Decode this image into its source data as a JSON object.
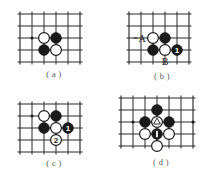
{
  "figure": {
    "panel_count": 4
  },
  "panels": {
    "a": {
      "caption": "( a )",
      "grid": {
        "cols": 6,
        "rows": 5,
        "spacing": 12
      },
      "star_points": [
        {
          "col": 1,
          "row": 2
        }
      ],
      "stones": [
        {
          "col": 2,
          "row": 2,
          "color": "white",
          "label": ""
        },
        {
          "col": 3,
          "row": 2,
          "color": "black",
          "label": ""
        },
        {
          "col": 2,
          "row": 3,
          "color": "black",
          "label": ""
        },
        {
          "col": 3,
          "row": 3,
          "color": "white",
          "label": ""
        }
      ],
      "annotations": []
    },
    "b": {
      "caption": "( b )",
      "grid": {
        "cols": 6,
        "rows": 5,
        "spacing": 12
      },
      "star_points": [],
      "stones": [
        {
          "col": 2,
          "row": 2,
          "color": "white",
          "label": ""
        },
        {
          "col": 3,
          "row": 2,
          "color": "black",
          "label": ""
        },
        {
          "col": 2,
          "row": 3,
          "color": "black",
          "label": ""
        },
        {
          "col": 3,
          "row": 3,
          "color": "white",
          "label": ""
        },
        {
          "col": 4,
          "row": 3,
          "color": "black",
          "label": "1"
        }
      ],
      "annotations": [
        {
          "text": "A",
          "col": 1,
          "row": 2,
          "placement": "left",
          "leader": true
        },
        {
          "text": "B",
          "col": 3,
          "row": 4,
          "placement": "below",
          "leader": false
        }
      ]
    },
    "c": {
      "caption": "( c )",
      "grid": {
        "cols": 6,
        "rows": 5,
        "spacing": 12
      },
      "star_points": [
        {
          "col": 1,
          "row": 1
        }
      ],
      "stones": [
        {
          "col": 2,
          "row": 1,
          "color": "white",
          "label": ""
        },
        {
          "col": 3,
          "row": 1,
          "color": "black",
          "label": ""
        },
        {
          "col": 2,
          "row": 2,
          "color": "black",
          "label": ""
        },
        {
          "col": 3,
          "row": 2,
          "color": "white",
          "label": ""
        },
        {
          "col": 4,
          "row": 2,
          "color": "black",
          "label": "1"
        },
        {
          "col": 3,
          "row": 3,
          "color": "white",
          "label": "2"
        }
      ],
      "annotations": []
    },
    "d": {
      "caption": "( d )",
      "grid": {
        "cols": 7,
        "rows": 5,
        "spacing": 12
      },
      "star_points": [
        {
          "col": 1,
          "row": 2
        },
        {
          "col": 6,
          "row": 2
        }
      ],
      "stones": [
        {
          "col": 3,
          "row": 1,
          "color": "black",
          "label": ""
        },
        {
          "col": 2,
          "row": 2,
          "color": "black",
          "label": ""
        },
        {
          "col": 3,
          "row": 2,
          "color": "white",
          "label": "",
          "mark": "triangle"
        },
        {
          "col": 4,
          "row": 2,
          "color": "black",
          "label": ""
        },
        {
          "col": 2,
          "row": 3,
          "color": "white",
          "label": ""
        },
        {
          "col": 3,
          "row": 3,
          "color": "black",
          "label": "",
          "mark": "bar"
        },
        {
          "col": 4,
          "row": 3,
          "color": "white",
          "label": ""
        },
        {
          "col": 3,
          "row": 4,
          "color": "white",
          "label": ""
        }
      ],
      "annotations": []
    }
  },
  "colors": {
    "grid": "#2b2b2b",
    "black_stone": "#1a1a1a",
    "white_stone": "#ffffff",
    "caption_text": "#5a5a5a",
    "label_text": "#1a1a1a",
    "background": "#ffffff"
  }
}
